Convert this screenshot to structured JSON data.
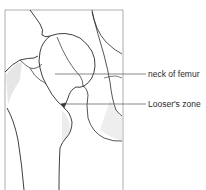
{
  "diagram": {
    "labels": [
      {
        "id": "neck",
        "text": "neck of femur"
      },
      {
        "id": "looser",
        "text": "Looser's zone"
      }
    ],
    "colors": {
      "line": "#2a2a2a",
      "frame": "#9a9a9a",
      "leader": "#555555",
      "shade": "#d8d8d8",
      "background": "#ffffff"
    }
  }
}
